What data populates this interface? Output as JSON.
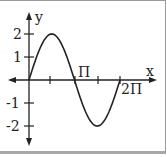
{
  "chart_data": {
    "type": "line",
    "title": "",
    "xlabel": "x",
    "ylabel": "y",
    "function": "y = 2 sin(x)",
    "x_ticks": [
      "",
      "Π",
      "",
      "2Π"
    ],
    "x_tick_values": [
      1.5708,
      3.1416,
      4.7124,
      6.2832
    ],
    "y_ticks": [
      "2",
      "1",
      "-1",
      "-2"
    ],
    "y_tick_values": [
      2,
      1,
      -1,
      -2
    ],
    "xlim": [
      -1.4,
      7.5
    ],
    "ylim": [
      -2.7,
      2.6
    ],
    "series": [
      {
        "name": "2 sin x",
        "x": [
          0,
          0.785,
          1.571,
          2.356,
          3.142,
          3.927,
          4.712,
          5.498,
          6.283
        ],
        "values": [
          0,
          1.41,
          2,
          1.41,
          0,
          -1.41,
          -2,
          -1.41,
          0
        ]
      }
    ],
    "grid": false,
    "legend": "none"
  },
  "labels": {
    "x_axis": "x",
    "y_axis": "y",
    "pi": "Π",
    "two_pi": "2Π",
    "y2": "2",
    "y1": "1",
    "ym1": "-1",
    "ym2": "-2"
  }
}
